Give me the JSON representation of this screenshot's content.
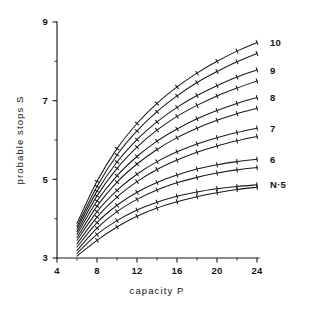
{
  "chart_data": {
    "type": "line",
    "title": "",
    "xlabel": "capacity  P",
    "ylabel": "probable stops  S",
    "xlim": [
      4,
      24
    ],
    "ylim": [
      3,
      9
    ],
    "grid": false,
    "legend_position": "right-of-curve-ends",
    "x_major_ticks": [
      4,
      8,
      12,
      16,
      20,
      24
    ],
    "x_major_tick_labels": [
      "4",
      "8",
      "12",
      "16",
      "20",
      "24"
    ],
    "x_minor_ticks": [
      6,
      10,
      14,
      18,
      22
    ],
    "y_major_ticks": [
      3,
      5,
      7,
      9
    ],
    "y_major_tick_labels": [
      "3",
      "5",
      "7",
      "9"
    ],
    "y_minor_ticks": [
      4,
      6,
      8
    ],
    "x": [
      6,
      8,
      10,
      12,
      14,
      16,
      18,
      20,
      22,
      24
    ],
    "marker": "plus-tick",
    "series": [
      {
        "name": "10-upper",
        "label": "10",
        "label_x": 24,
        "values": [
          3.88,
          4.95,
          5.78,
          6.42,
          6.93,
          7.35,
          7.7,
          8.0,
          8.26,
          8.48
        ]
      },
      {
        "name": "10-lower",
        "label": "",
        "label_x": 24,
        "values": [
          3.8,
          4.82,
          5.62,
          6.23,
          6.72,
          7.12,
          7.46,
          7.74,
          7.99,
          8.2
        ]
      },
      {
        "name": "9-upper",
        "label": "9",
        "label_x": 24,
        "values": [
          3.74,
          4.7,
          5.44,
          6.01,
          6.46,
          6.83,
          7.13,
          7.38,
          7.6,
          7.78
        ]
      },
      {
        "name": "9-lower",
        "label": "",
        "label_x": 24,
        "values": [
          3.67,
          4.58,
          5.28,
          5.82,
          6.25,
          6.6,
          6.88,
          7.12,
          7.32,
          7.5
        ]
      },
      {
        "name": "8-upper",
        "label": "8",
        "label_x": 24,
        "values": [
          3.6,
          4.45,
          5.09,
          5.58,
          5.97,
          6.28,
          6.54,
          6.75,
          6.93,
          7.08
        ]
      },
      {
        "name": "8-lower",
        "label": "",
        "label_x": 24,
        "values": [
          3.52,
          4.32,
          4.93,
          5.39,
          5.76,
          6.06,
          6.3,
          6.5,
          6.67,
          6.81
        ]
      },
      {
        "name": "7-upper",
        "label": "7",
        "label_x": 24,
        "values": [
          3.45,
          4.18,
          4.72,
          5.13,
          5.45,
          5.7,
          5.9,
          6.06,
          6.19,
          6.3
        ]
      },
      {
        "name": "7-lower",
        "label": "",
        "label_x": 24,
        "values": [
          3.36,
          4.04,
          4.55,
          4.94,
          5.25,
          5.49,
          5.69,
          5.85,
          5.98,
          6.09
        ]
      },
      {
        "name": "6-upper",
        "label": "6",
        "label_x": 24,
        "values": [
          3.28,
          3.9,
          4.34,
          4.67,
          4.92,
          5.11,
          5.26,
          5.37,
          5.45,
          5.51
        ]
      },
      {
        "name": "6-lower",
        "label": "",
        "label_x": 24,
        "values": [
          3.19,
          3.76,
          4.18,
          4.49,
          4.73,
          4.91,
          5.05,
          5.16,
          5.24,
          5.3
        ]
      },
      {
        "name": "5-upper",
        "label": "N·5",
        "label_x": 24,
        "values": [
          3.12,
          3.6,
          3.95,
          4.22,
          4.42,
          4.57,
          4.68,
          4.76,
          4.82,
          4.86
        ]
      },
      {
        "name": "5-lower",
        "label": "",
        "label_x": 24,
        "values": [
          3.05,
          3.45,
          3.79,
          4.06,
          4.27,
          4.43,
          4.56,
          4.66,
          4.74,
          4.8
        ]
      }
    ]
  },
  "figure": {
    "background_color": "#ffffff",
    "ink_color": "#1b1b1b"
  }
}
